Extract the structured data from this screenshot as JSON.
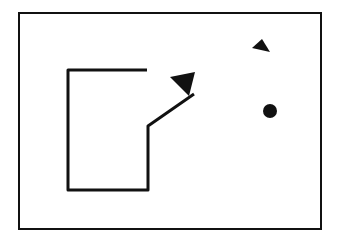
{
  "diagram": {
    "colors": {
      "stroke": "#111111",
      "background": "#ffffff"
    },
    "frame": {
      "x": 19,
      "y": 13,
      "w": 302,
      "h": 216
    },
    "path_points": "147,70 68,70 68,190 148,190 148,126 194,94",
    "arrowhead_points": "170,77 195,72 189,96",
    "triangle_points": "262,39 270,52 252,48",
    "dot": {
      "cx": 270,
      "cy": 111,
      "r": 7
    }
  }
}
